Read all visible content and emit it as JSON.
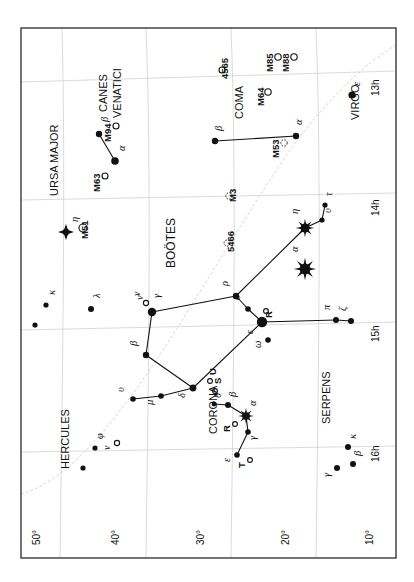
{
  "figure": {
    "kind": "star-chart",
    "orientation_note": "chart rotated 90 degrees counter-clockwise on the page",
    "border": {
      "x": 21,
      "y": 28,
      "w": 375,
      "h": 530,
      "color": "#3a3a3a"
    },
    "grid_color": "#c9c9c9",
    "ink_color": "#111111"
  },
  "axes": {
    "ra_label_suffix": "h",
    "ra_ticks": [
      {
        "label": "13h",
        "x": 379,
        "y": 96
      },
      {
        "label": "14h",
        "x": 379,
        "y": 216
      },
      {
        "label": "15h",
        "x": 379,
        "y": 342
      },
      {
        "label": "16h",
        "x": 379,
        "y": 462
      }
    ],
    "dec_ticks": [
      {
        "label": "50°",
        "x": 40,
        "y": 545
      },
      {
        "label": "40°",
        "x": 119,
        "y": 545
      },
      {
        "label": "30°",
        "x": 204,
        "y": 545
      },
      {
        "label": "20°",
        "x": 289,
        "y": 545
      },
      {
        "label": "10°",
        "x": 373,
        "y": 545
      }
    ]
  },
  "constellation_names": [
    {
      "name": "URSA MAJOR",
      "x": 58,
      "y": 196,
      "size": 11
    },
    {
      "name": "CANES",
      "x": 107,
      "y": 112,
      "size": 11
    },
    {
      "name": "VENATICI",
      "x": 121,
      "y": 118,
      "size": 11
    },
    {
      "name": "COMA",
      "x": 243,
      "y": 119,
      "size": 11
    },
    {
      "name": "VIRGO",
      "x": 359,
      "y": 120,
      "size": 11
    },
    {
      "name": "BOÖTES",
      "x": 175,
      "y": 268,
      "size": 12
    },
    {
      "name": "HERCULES",
      "x": 69,
      "y": 469,
      "size": 11
    },
    {
      "name": "CORONA",
      "x": 217,
      "y": 434,
      "size": 11
    },
    {
      "name": "SERPENS",
      "x": 330,
      "y": 424,
      "size": 11
    }
  ],
  "stars": [
    {
      "id": "uma-eta",
      "label": "η",
      "x": 66,
      "y": 232,
      "r": 4.2,
      "type": "burst4",
      "lx": 78,
      "ly": 222
    },
    {
      "id": "uma-kappa",
      "label": "κ",
      "x": 46,
      "y": 305,
      "r": 2.6,
      "type": "dot",
      "lx": 55,
      "ly": 295
    },
    {
      "id": "uma-s1",
      "label": "",
      "x": 35,
      "y": 325,
      "r": 2.6,
      "type": "dot",
      "lx": 0,
      "ly": 0
    },
    {
      "id": "uma-lambda",
      "label": "λ",
      "x": 91,
      "y": 309,
      "r": 3.0,
      "type": "dot",
      "lx": 100,
      "ly": 298
    },
    {
      "id": "cvn-beta",
      "label": "β",
      "x": 99,
      "y": 134,
      "r": 3.2,
      "type": "dot",
      "lx": 108,
      "ly": 122
    },
    {
      "id": "cvn-alpha",
      "label": "α",
      "x": 115,
      "y": 161,
      "r": 3.8,
      "type": "dot",
      "lx": 125,
      "ly": 151
    },
    {
      "id": "com-beta",
      "label": "β",
      "x": 215,
      "y": 141,
      "r": 3.2,
      "type": "dot",
      "lx": 222,
      "ly": 131
    },
    {
      "id": "com-alpha",
      "label": "α",
      "x": 296,
      "y": 136,
      "r": 3.2,
      "type": "dot",
      "lx": 302,
      "ly": 125
    },
    {
      "id": "vir-eps",
      "label": "ε",
      "x": 352,
      "y": 95,
      "r": 3.6,
      "type": "dot",
      "lx": 360,
      "ly": 86
    },
    {
      "id": "boo-eta",
      "label": "η",
      "x": 305,
      "y": 228,
      "r": 5.6,
      "type": "burst8",
      "lx": 298,
      "ly": 214
    },
    {
      "id": "boo-tau",
      "label": "τ",
      "x": 325,
      "y": 205,
      "r": 2.6,
      "type": "dot",
      "lx": 332,
      "ly": 196
    },
    {
      "id": "boo-ups",
      "label": "υ",
      "x": 322,
      "y": 220,
      "r": 2.6,
      "type": "dot",
      "lx": 331,
      "ly": 213
    },
    {
      "id": "boo-alpha",
      "label": "α",
      "x": 305,
      "y": 269,
      "r": 6.8,
      "type": "burst8",
      "lx": 298,
      "ly": 252
    },
    {
      "id": "boo-rho",
      "label": "ρ",
      "x": 236,
      "y": 296,
      "r": 3.2,
      "type": "dot",
      "lx": 228,
      "ly": 286
    },
    {
      "id": "boo-sigma",
      "label": "σ",
      "x": 248,
      "y": 309,
      "r": 2.8,
      "type": "dot",
      "lx": 240,
      "ly": 300
    },
    {
      "id": "boo-eps",
      "label": "ε",
      "x": 262,
      "y": 322,
      "r": 5.2,
      "type": "dot",
      "lx": 253,
      "ly": 334
    },
    {
      "id": "boo-nu",
      "label": "ν",
      "x": 152,
      "y": 312,
      "r": 4.2,
      "type": "dot",
      "lx": 143,
      "ly": 300
    },
    {
      "id": "boo-gamma",
      "label": "γ",
      "x": 152,
      "y": 312,
      "r": 0.1,
      "type": "none",
      "lx": 160,
      "ly": 298
    },
    {
      "id": "boo-beta",
      "label": "β",
      "x": 146,
      "y": 355,
      "r": 3.2,
      "type": "dot",
      "lx": 137,
      "ly": 346
    },
    {
      "id": "boo-delta",
      "label": "δ",
      "x": 193,
      "y": 388,
      "r": 3.4,
      "type": "dot",
      "lx": 185,
      "ly": 398
    },
    {
      "id": "boo-mu",
      "label": "μ",
      "x": 161,
      "y": 396,
      "r": 2.8,
      "type": "dot",
      "lx": 153,
      "ly": 405
    },
    {
      "id": "boo-sm",
      "label": "υ",
      "x": 133,
      "y": 399,
      "r": 2.8,
      "type": "dot",
      "lx": 124,
      "ly": 392
    },
    {
      "id": "boo-omega",
      "label": "ω",
      "x": 268,
      "y": 340,
      "r": 2.8,
      "type": "dot",
      "lx": 261,
      "ly": 348
    },
    {
      "id": "boo-pi",
      "label": "π",
      "x": 336,
      "y": 320,
      "r": 3.0,
      "type": "dot",
      "lx": 330,
      "ly": 310
    },
    {
      "id": "boo-zeta",
      "label": "ζ",
      "x": 351,
      "y": 321,
      "r": 3.0,
      "type": "dot",
      "lx": 346,
      "ly": 311
    },
    {
      "id": "crb-theta",
      "label": "θ",
      "x": 214,
      "y": 404,
      "r": 2.4,
      "type": "dot",
      "lx": 221,
      "ly": 398
    },
    {
      "id": "crb-beta",
      "label": "β",
      "x": 228,
      "y": 405,
      "r": 3.0,
      "type": "dot",
      "lx": 236,
      "ly": 397
    },
    {
      "id": "crb-alpha",
      "label": "α",
      "x": 246,
      "y": 416,
      "r": 4.8,
      "type": "burst8",
      "lx": 256,
      "ly": 406
    },
    {
      "id": "crb-gamma",
      "label": "γ",
      "x": 248,
      "y": 432,
      "r": 2.8,
      "type": "dot",
      "lx": 256,
      "ly": 440
    },
    {
      "id": "crb-eps",
      "label": "ε",
      "x": 237,
      "y": 455,
      "r": 2.8,
      "type": "dot",
      "lx": 230,
      "ly": 462
    },
    {
      "id": "her-phi",
      "label": "φ",
      "x": 95,
      "y": 448,
      "r": 2.6,
      "type": "dot",
      "lx": 103,
      "ly": 439
    },
    {
      "id": "her-s2",
      "label": "",
      "x": 83,
      "y": 468,
      "r": 2.6,
      "type": "dot",
      "lx": 0,
      "ly": 0
    },
    {
      "id": "ser-kappa",
      "label": "κ",
      "x": 348,
      "y": 447,
      "r": 3.0,
      "type": "dot",
      "lx": 356,
      "ly": 439
    },
    {
      "id": "ser-beta",
      "label": "β",
      "x": 353,
      "y": 464,
      "r": 3.0,
      "type": "dot",
      "lx": 361,
      "ly": 456
    },
    {
      "id": "ser-gamma",
      "label": "γ",
      "x": 337,
      "y": 468,
      "r": 3.0,
      "type": "dot",
      "lx": 330,
      "ly": 477
    }
  ],
  "deep_sky": [
    {
      "id": "m51",
      "label": "M51",
      "x": 83,
      "y": 228,
      "kind": "open-circle",
      "r": 4.0,
      "lx": 88,
      "ly": 239
    },
    {
      "id": "m63",
      "label": "M63",
      "x": 105,
      "y": 176,
      "kind": "open-circle",
      "r": 3.0,
      "lx": 100,
      "ly": 192
    },
    {
      "id": "m94",
      "label": "M94",
      "x": 116,
      "y": 126,
      "kind": "open-circle",
      "r": 3.0,
      "lx": 111,
      "ly": 142
    },
    {
      "id": "n4565",
      "label": "4565",
      "x": 222,
      "y": 70,
      "kind": "open-circle",
      "r": 3.0,
      "lx": 228,
      "ly": 79
    },
    {
      "id": "m64",
      "label": "M64",
      "x": 268,
      "y": 92,
      "kind": "open-circle",
      "r": 3.2,
      "lx": 264,
      "ly": 106
    },
    {
      "id": "m85",
      "label": "M85",
      "x": 278,
      "y": 57,
      "kind": "open-circle",
      "r": 3.2,
      "lx": 273,
      "ly": 72
    },
    {
      "id": "m88",
      "label": "M88",
      "x": 294,
      "y": 57,
      "kind": "open-circle",
      "r": 3.2,
      "lx": 289,
      "ly": 72
    },
    {
      "id": "m53",
      "label": "M53",
      "x": 284,
      "y": 143,
      "kind": "cluster",
      "r": 3.2,
      "lx": 279,
      "ly": 158
    },
    {
      "id": "m3",
      "label": "M3",
      "x": 229,
      "y": 196,
      "kind": "cluster",
      "r": 3.2,
      "lx": 236,
      "ly": 202
    },
    {
      "id": "n5466",
      "label": "5466",
      "x": 227,
      "y": 243,
      "kind": "cluster",
      "r": 3.0,
      "lx": 234,
      "ly": 252
    },
    {
      "id": "crb-R",
      "label": "R",
      "x": 266,
      "y": 311,
      "kind": "open-circle",
      "r": 2.4,
      "lx": 272,
      "ly": 318
    },
    {
      "id": "crb-R2",
      "label": "R",
      "x": 235,
      "y": 424,
      "kind": "open-circle",
      "r": 2.4,
      "lx": 230,
      "ly": 432
    },
    {
      "id": "crb-T",
      "label": "T",
      "x": 250,
      "y": 460,
      "kind": "open-circle",
      "r": 2.4,
      "lx": 245,
      "ly": 468
    },
    {
      "id": "crb-S",
      "label": "S",
      "x": 215,
      "y": 391,
      "kind": "open-circle",
      "r": 2.4,
      "lx": 221,
      "ly": 384
    },
    {
      "id": "crb-U",
      "label": "U",
      "x": 210,
      "y": 381,
      "kind": "open-circle",
      "r": 2.4,
      "lx": 216,
      "ly": 375
    },
    {
      "id": "boo-v1",
      "label": "ν",
      "x": 146,
      "y": 303,
      "kind": "open-circle",
      "r": 2.6,
      "lx": 140,
      "ly": 296
    },
    {
      "id": "her-v",
      "label": "ν",
      "x": 117,
      "y": 443,
      "kind": "open-circle",
      "r": 2.6,
      "lx": 110,
      "ly": 450
    }
  ],
  "constellation_lines": [
    {
      "from": "cvn-beta",
      "to": "cvn-alpha"
    },
    {
      "from": "com-beta",
      "to": "com-alpha"
    },
    {
      "from": "boo-eta",
      "to": "boo-ups"
    },
    {
      "from": "boo-ups",
      "to": "boo-tau"
    },
    {
      "from": "boo-eta",
      "to": "boo-rho"
    },
    {
      "from": "boo-rho",
      "to": "boo-sigma"
    },
    {
      "from": "boo-sigma",
      "to": "boo-eps"
    },
    {
      "from": "boo-rho",
      "to": "boo-nu"
    },
    {
      "from": "boo-nu",
      "to": "boo-beta"
    },
    {
      "from": "boo-beta",
      "to": "boo-delta"
    },
    {
      "from": "boo-delta",
      "to": "boo-mu"
    },
    {
      "from": "boo-mu",
      "to": "boo-sm"
    },
    {
      "from": "boo-delta",
      "to": "boo-eps"
    },
    {
      "from": "boo-eps",
      "to": "boo-pi"
    },
    {
      "from": "boo-pi",
      "to": "boo-zeta"
    },
    {
      "from": "crb-theta",
      "to": "crb-beta"
    },
    {
      "from": "crb-beta",
      "to": "crb-alpha"
    },
    {
      "from": "crb-alpha",
      "to": "crb-gamma"
    },
    {
      "from": "crb-gamma",
      "to": "crb-eps"
    }
  ],
  "grid_lines": [
    {
      "type": "ra",
      "d": "M 21 82 L 396 71"
    },
    {
      "type": "ra",
      "d": "M 21 200 L 396 193"
    },
    {
      "type": "ra",
      "d": "M 21 330 L 396 322"
    },
    {
      "type": "ra",
      "d": "M 21 452 L 396 446"
    },
    {
      "type": "dec",
      "d": "M 62 28 C 66 180, 62 400, 60 558"
    },
    {
      "type": "dec",
      "d": "M 146 28 C 152 180, 148 400, 146 558"
    },
    {
      "type": "dec",
      "d": "M 231 28 C 237 180, 233 400, 231 558"
    },
    {
      "type": "dec",
      "d": "M 316 28 C 322 180, 318 400, 316 558"
    },
    {
      "type": "ecliptic",
      "d": "M 21 494 C 110 470, 200 280, 290 150 C 330 95, 370 60, 396 45"
    }
  ],
  "chart_data": {
    "type": "scatter",
    "title": "",
    "xlabel": "Right Ascension (hours)",
    "ylabel": "Declination (degrees)",
    "xlim": [
      16,
      12.8
    ],
    "ylim": [
      5,
      55
    ],
    "grid": true,
    "legend": "none",
    "categories": [
      "star",
      "galaxy",
      "globular-cluster"
    ],
    "annotations": [
      "URSA MAJOR",
      "CANES VENATICI",
      "COMA",
      "VIRGO",
      "BOÖTES",
      "HERCULES",
      "CORONA",
      "SERPENS"
    ]
  }
}
